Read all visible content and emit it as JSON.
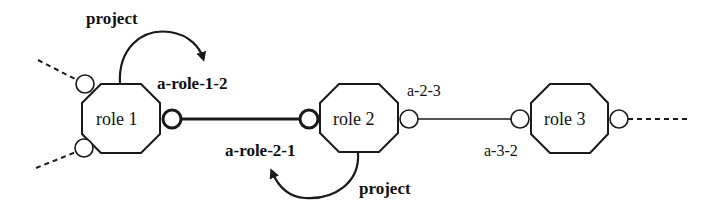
{
  "diagram": {
    "roles": [
      {
        "id": "role1",
        "label": "role 1"
      },
      {
        "id": "role2",
        "label": "role 2"
      },
      {
        "id": "role3",
        "label": "role 3"
      }
    ],
    "associations": {
      "a_role_1_2": "a-role-1-2",
      "a_role_2_1": "a-role-2-1",
      "a_2_3": "a-2-3",
      "a_3_2": "a-3-2"
    },
    "actions": {
      "project_top": "project",
      "project_bottom": "project"
    },
    "colors": {
      "stroke": "#1a1a1a",
      "background": "#ffffff"
    }
  }
}
